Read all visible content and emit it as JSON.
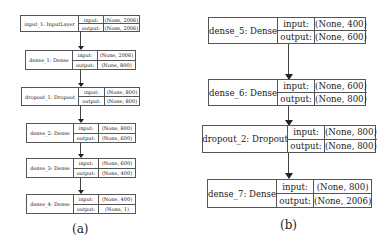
{
  "panel_a": {
    "caption": "(a)",
    "nodes": [
      {
        "name": "input_1: InputLayer",
        "input_label": "input:",
        "input": "(None, 2006)",
        "output_label": "output:",
        "output": "(None, 2006)"
      },
      {
        "name": "dense_1: Dense",
        "input_label": "input:",
        "input": "(None, 2006)",
        "output_label": "output:",
        "output": "(None, 800)"
      },
      {
        "name": "dropout_1: Dropout",
        "input_label": "input:",
        "input": "(None, 800)",
        "output_label": "output:",
        "output": "(None, 800)"
      },
      {
        "name": "dense_2: Dense",
        "input_label": "input:",
        "input": "(None, 800)",
        "output_label": "output:",
        "output": "(None, 600)"
      },
      {
        "name": "dense_3: Dense",
        "input_label": "input:",
        "input": "(None, 600)",
        "output_label": "output:",
        "output": "(None, 400)"
      },
      {
        "name": "dense_4: Dense",
        "input_label": "input:",
        "input": "(None, 400)",
        "output_label": "output:",
        "output": "(None, 1)"
      }
    ]
  },
  "panel_b": {
    "caption": "(b)",
    "nodes": [
      {
        "name": "dense_5: Dense",
        "input_label": "input:",
        "input": "(None, 400)",
        "output_label": "output:",
        "output": "(None, 600)"
      },
      {
        "name": "dense_6: Dense",
        "input_label": "input:",
        "input": "(None, 600)",
        "output_label": "output:",
        "output": "(None, 800)"
      },
      {
        "name": "dropout_2: Dropout",
        "input_label": "input:",
        "input": "(None, 800)",
        "output_label": "output:",
        "output": "(None, 800)"
      },
      {
        "name": "dense_7: Dense",
        "input_label": "input:",
        "input": "(None, 800)",
        "output_label": "output:",
        "output": "(None, 2006)"
      }
    ]
  }
}
